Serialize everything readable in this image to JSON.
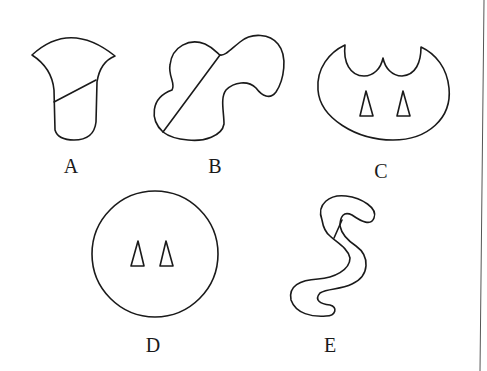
{
  "figure": {
    "background": "#ffffff",
    "stroke_color": "#1a1a1a",
    "panels": [
      {
        "id": "A",
        "label": "A",
        "description": "bell/flare-shaped outline divided by a diagonal line"
      },
      {
        "id": "B",
        "label": "B",
        "description": "irregular lobed blob divided by a diagonal line"
      },
      {
        "id": "C",
        "label": "C",
        "description": "oval with scalloped top notch containing two small triangles"
      },
      {
        "id": "D",
        "label": "D",
        "description": "circle containing two small triangles"
      },
      {
        "id": "E",
        "label": "E",
        "description": "S-shaped worm-like outline with a short internal line"
      }
    ]
  }
}
